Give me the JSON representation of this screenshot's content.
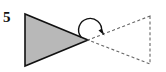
{
  "figure": {
    "label": "5",
    "background_color": "#ffffff",
    "stroke_color": "#111111",
    "solid_fill_color": "#b8b8b8",
    "dashed_stroke_color": "#666666",
    "shapes": {
      "solid_triangle": {
        "name": "preimage-triangle",
        "style": "solid outline with gray fill",
        "fill": "#b8b8b8",
        "stroke": "#111111",
        "stroke_width": 1.6,
        "points": "25,14 25,66 88,40",
        "vertices": [
          {
            "x": 25,
            "y": 14
          },
          {
            "x": 25,
            "y": 66
          },
          {
            "x": 88,
            "y": 40
          }
        ]
      },
      "dashed_triangle": {
        "name": "image-triangle",
        "style": "dashed outline, no fill",
        "fill": "none",
        "stroke": "#666666",
        "stroke_width": 1.1,
        "dash_pattern": "3,2.4",
        "points": "150,16 150,64 88,40",
        "vertices": [
          {
            "x": 150,
            "y": 16
          },
          {
            "x": 150,
            "y": 64
          },
          {
            "x": 88,
            "y": 40
          }
        ]
      },
      "rotation_arrow": {
        "name": "rotation-arc-arrow",
        "style": "curved arc with solid arrowhead at right end",
        "stroke": "#111111",
        "stroke_width": 1.4,
        "arc_path": "M 81,37 A 11.5,11.5 0 1 1 101.5,31.5",
        "arrowhead_points": "104.5,35.5 98.5,30.5 102,28.5",
        "direction": "clockwise-to-the-right"
      },
      "shared_vertex": {
        "name": "center-of-rotation",
        "x": 88,
        "y": 40
      }
    }
  }
}
